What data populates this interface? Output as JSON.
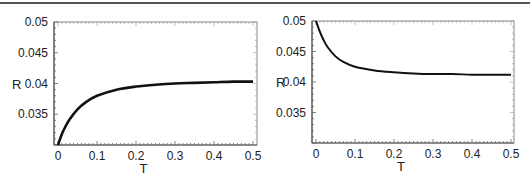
{
  "chart_data": [
    {
      "type": "line",
      "title": "",
      "xlabel": "T",
      "ylabel": "R",
      "xlim": [
        0,
        0.5
      ],
      "ylim": [
        0.03,
        0.05
      ],
      "xticks": [
        "0",
        "0.1",
        "0.2",
        "0.3",
        "0.4",
        "0.5"
      ],
      "yticks": [
        "0.035",
        "0.04",
        "0.045",
        "0.05"
      ],
      "grid": false,
      "legend": null,
      "series": [
        {
          "name": "R(T)",
          "x": [
            0,
            0.01,
            0.02,
            0.03,
            0.05,
            0.07,
            0.1,
            0.15,
            0.2,
            0.25,
            0.3,
            0.35,
            0.4,
            0.45,
            0.5
          ],
          "values": [
            0.03,
            0.0318,
            0.0331,
            0.0342,
            0.0358,
            0.0369,
            0.038,
            0.039,
            0.0395,
            0.0398,
            0.04,
            0.0401,
            0.0402,
            0.0403,
            0.0403
          ]
        }
      ]
    },
    {
      "type": "line",
      "title": "",
      "xlabel": "T",
      "ylabel": "R",
      "xlim": [
        0,
        0.5
      ],
      "ylim": [
        0.03,
        0.05
      ],
      "xticks": [
        "0",
        "0.1",
        "0.2",
        "0.3",
        "0.4",
        "0.5"
      ],
      "yticks": [
        "0.035",
        "0.04",
        "0.045",
        "0.05"
      ],
      "grid": false,
      "legend": null,
      "series": [
        {
          "name": "R(T)",
          "x": [
            0,
            0.01,
            0.02,
            0.03,
            0.05,
            0.07,
            0.1,
            0.15,
            0.2,
            0.25,
            0.3,
            0.35,
            0.4,
            0.45,
            0.5
          ],
          "values": [
            0.05,
            0.0482,
            0.0468,
            0.0457,
            0.0442,
            0.0433,
            0.0425,
            0.0419,
            0.0416,
            0.0414,
            0.0413,
            0.0413,
            0.0412,
            0.0412,
            0.0412
          ]
        }
      ]
    }
  ]
}
